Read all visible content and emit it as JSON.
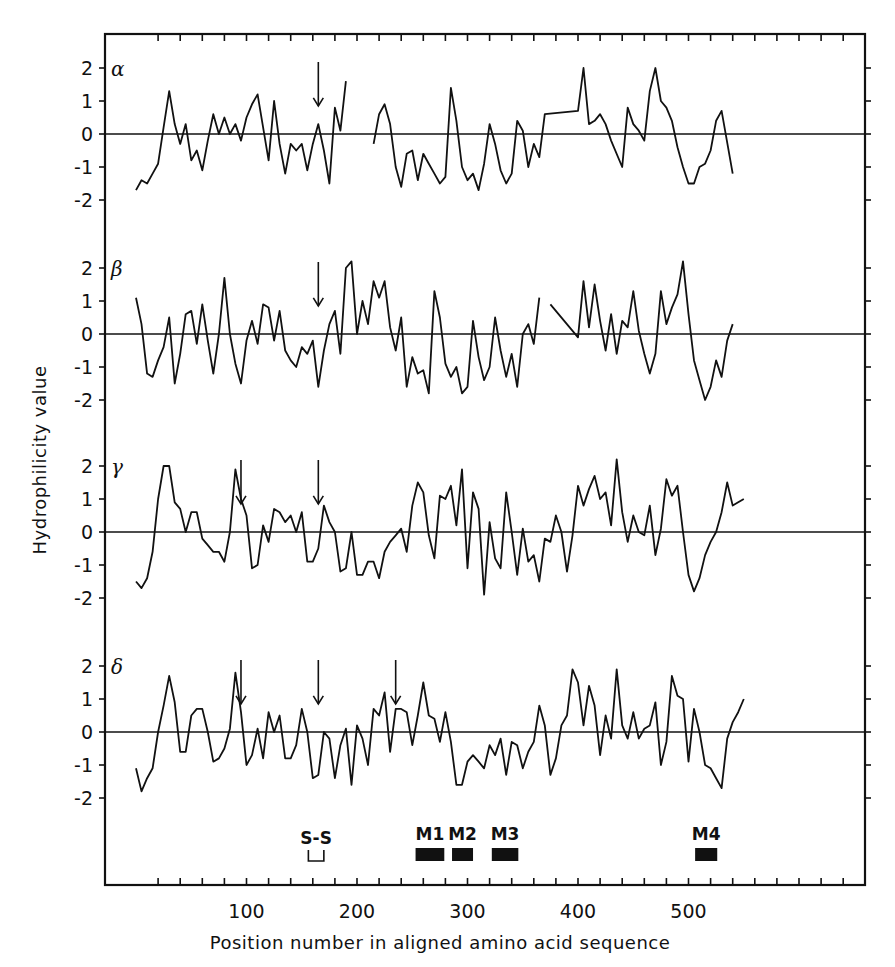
{
  "chart_data": {
    "type": "line",
    "title": "",
    "xlabel": "Position number in aligned amino acid sequence",
    "ylabel": "Hydrophilicity value",
    "xlim": [
      0,
      550
    ],
    "x_ticks": [
      100,
      200,
      300,
      400,
      500
    ],
    "x_minor_tick_step": 20,
    "ylim_per_panel": [
      -2,
      2
    ],
    "y_ticks": [
      2,
      1,
      0,
      -1,
      -2
    ],
    "y_tick_labels": [
      "2",
      "1",
      "0",
      "-1",
      "-2"
    ],
    "grid": false,
    "legend": null,
    "panels": [
      {
        "name": "α",
        "arrows_at": [
          165
        ],
        "x": [
          0,
          5,
          10,
          15,
          20,
          25,
          30,
          35,
          40,
          45,
          50,
          55,
          60,
          65,
          70,
          75,
          80,
          85,
          90,
          95,
          100,
          105,
          110,
          115,
          120,
          125,
          130,
          135,
          140,
          145,
          150,
          155,
          160,
          165,
          170,
          175,
          180,
          185,
          190,
          195,
          200,
          210,
          215,
          220,
          225,
          230,
          235,
          240,
          245,
          250,
          255,
          260,
          265,
          270,
          275,
          280,
          285,
          290,
          295,
          300,
          305,
          310,
          315,
          320,
          325,
          330,
          335,
          340,
          345,
          350,
          355,
          360,
          365,
          370,
          400,
          405,
          410,
          415,
          420,
          425,
          430,
          440,
          445,
          450,
          455,
          460,
          465,
          470,
          475,
          480,
          485,
          490,
          495,
          500,
          505,
          510,
          515,
          520,
          525,
          530,
          540
        ],
        "values": [
          -1.7,
          -1.4,
          -1.5,
          -1.2,
          -0.9,
          0.2,
          1.3,
          0.3,
          -0.3,
          0.3,
          -0.8,
          -0.5,
          -1.1,
          -0.2,
          0.6,
          0.0,
          0.5,
          0.0,
          0.3,
          -0.2,
          0.5,
          0.9,
          1.2,
          0.2,
          -0.8,
          1.0,
          -0.3,
          -1.2,
          -0.3,
          -0.5,
          -0.3,
          -1.1,
          -0.3,
          0.3,
          -0.5,
          -1.5,
          0.8,
          0.1,
          1.6,
          null,
          2.0,
          null,
          -0.3,
          0.6,
          0.9,
          0.3,
          -1.0,
          -1.6,
          -0.6,
          -0.5,
          -1.4,
          -0.6,
          -0.9,
          -1.2,
          -1.5,
          -1.3,
          1.4,
          0.4,
          -1.0,
          -1.4,
          -1.2,
          -1.7,
          -0.9,
          0.3,
          -0.3,
          -1.1,
          -1.5,
          -1.2,
          0.4,
          0.1,
          -1.0,
          -0.3,
          -0.7,
          0.6,
          0.7,
          2.0,
          0.3,
          0.4,
          0.6,
          0.3,
          -0.2,
          -1.0,
          0.8,
          0.3,
          0.1,
          -0.2,
          1.3,
          2.0,
          1.0,
          0.8,
          0.4,
          -0.4,
          -1.0,
          -1.5,
          -1.5,
          -1.0,
          -0.9,
          -0.5,
          0.4,
          0.7,
          -1.2
        ]
      },
      {
        "name": "β",
        "arrows_at": [
          165
        ],
        "x": [
          0,
          5,
          10,
          15,
          20,
          25,
          30,
          35,
          40,
          45,
          50,
          55,
          60,
          65,
          70,
          75,
          80,
          85,
          90,
          95,
          100,
          105,
          110,
          115,
          120,
          125,
          130,
          135,
          140,
          145,
          150,
          155,
          160,
          165,
          170,
          175,
          180,
          185,
          190,
          195,
          200,
          205,
          210,
          215,
          220,
          225,
          230,
          235,
          240,
          245,
          250,
          255,
          260,
          265,
          270,
          275,
          280,
          285,
          290,
          295,
          300,
          305,
          310,
          315,
          320,
          325,
          330,
          335,
          340,
          345,
          350,
          355,
          360,
          365,
          370,
          375,
          400,
          405,
          410,
          415,
          420,
          425,
          430,
          435,
          440,
          445,
          450,
          455,
          460,
          465,
          470,
          475,
          480,
          485,
          490,
          495,
          500,
          505,
          510,
          515,
          520,
          525,
          530,
          535,
          540
        ],
        "values": [
          1.1,
          0.3,
          -1.2,
          -1.3,
          -0.8,
          -0.4,
          0.5,
          -1.5,
          -0.6,
          0.6,
          0.7,
          -0.3,
          0.9,
          -0.2,
          -1.2,
          0.0,
          1.7,
          0.0,
          -0.9,
          -1.5,
          -0.2,
          0.4,
          -0.3,
          0.9,
          0.8,
          -0.2,
          0.7,
          -0.5,
          -0.8,
          -1.0,
          -0.4,
          -0.6,
          -0.2,
          -1.6,
          -0.5,
          0.3,
          0.7,
          -0.6,
          2.0,
          2.2,
          0.0,
          1.0,
          0.3,
          1.6,
          1.1,
          1.6,
          0.2,
          -0.5,
          0.5,
          -1.6,
          -0.7,
          -1.2,
          -1.1,
          -1.8,
          1.3,
          0.5,
          -0.9,
          -1.3,
          -1.0,
          -1.8,
          -1.6,
          0.4,
          -0.7,
          -1.4,
          -1.0,
          0.5,
          -0.5,
          -1.3,
          -0.6,
          -1.6,
          0.0,
          0.3,
          -0.3,
          1.1,
          null,
          0.9,
          -0.1,
          1.6,
          0.2,
          1.5,
          0.4,
          -0.5,
          0.6,
          -0.6,
          0.4,
          0.2,
          1.3,
          0.1,
          -0.6,
          -1.2,
          -0.6,
          1.3,
          0.3,
          0.8,
          1.2,
          2.2,
          0.6,
          -0.8,
          -1.4,
          -2.0,
          -1.6,
          -0.8,
          -1.3,
          -0.2,
          0.3,
          -0.1,
          -0.5
        ]
      },
      {
        "name": "γ",
        "arrows_at": [
          95,
          165
        ],
        "x": [
          0,
          5,
          10,
          15,
          20,
          25,
          30,
          35,
          40,
          45,
          50,
          55,
          60,
          65,
          70,
          75,
          80,
          85,
          90,
          95,
          100,
          105,
          110,
          115,
          120,
          125,
          130,
          135,
          140,
          145,
          150,
          155,
          160,
          165,
          170,
          175,
          180,
          185,
          190,
          195,
          200,
          205,
          210,
          215,
          220,
          225,
          230,
          235,
          240,
          245,
          250,
          255,
          260,
          265,
          270,
          275,
          280,
          285,
          290,
          295,
          300,
          305,
          310,
          315,
          320,
          325,
          330,
          335,
          340,
          345,
          350,
          355,
          360,
          365,
          370,
          375,
          380,
          385,
          390,
          395,
          400,
          405,
          410,
          415,
          420,
          425,
          430,
          435,
          440,
          445,
          450,
          455,
          460,
          465,
          470,
          475,
          480,
          485,
          490,
          495,
          500,
          505,
          510,
          515,
          520,
          525,
          530,
          535,
          540,
          545,
          550
        ],
        "values": [
          -1.5,
          -1.7,
          -1.4,
          -0.6,
          1.0,
          2.0,
          2.0,
          0.9,
          0.7,
          0.0,
          0.6,
          0.6,
          -0.2,
          -0.4,
          -0.6,
          -0.6,
          -0.9,
          0.0,
          1.9,
          1.0,
          0.5,
          -1.1,
          -1.0,
          0.2,
          -0.3,
          0.7,
          0.6,
          0.3,
          0.5,
          0.0,
          0.6,
          -0.9,
          -0.9,
          -0.5,
          0.8,
          0.3,
          0.0,
          -1.2,
          -1.1,
          0.0,
          -1.3,
          -1.3,
          -0.9,
          -0.9,
          -1.4,
          -0.6,
          -0.3,
          -0.1,
          0.1,
          -0.6,
          0.8,
          1.5,
          1.2,
          -0.1,
          -0.8,
          1.1,
          1.0,
          1.4,
          0.2,
          1.9,
          -1.1,
          1.2,
          0.7,
          -1.9,
          0.3,
          -0.8,
          -1.1,
          1.2,
          0.0,
          -1.3,
          0.1,
          -0.9,
          -0.7,
          -1.5,
          -0.2,
          -0.3,
          0.5,
          0.0,
          -1.2,
          -0.1,
          1.4,
          0.8,
          1.3,
          1.7,
          1.0,
          1.2,
          0.2,
          2.2,
          0.6,
          -0.3,
          0.5,
          0.0,
          -0.1,
          0.8,
          -0.7,
          0.1,
          1.6,
          1.1,
          1.4,
          0.0,
          -1.3,
          -1.8,
          -1.4,
          -0.7,
          -0.3,
          0.0,
          0.6,
          1.5,
          0.8,
          0.9,
          1.0
        ]
      },
      {
        "name": "δ",
        "arrows_at": [
          95,
          165,
          235
        ],
        "x": [
          0,
          5,
          10,
          15,
          20,
          25,
          30,
          35,
          40,
          45,
          50,
          55,
          60,
          65,
          70,
          75,
          80,
          85,
          90,
          95,
          100,
          105,
          110,
          115,
          120,
          125,
          130,
          135,
          140,
          145,
          150,
          155,
          160,
          165,
          170,
          175,
          180,
          185,
          190,
          195,
          200,
          205,
          210,
          215,
          220,
          225,
          230,
          235,
          240,
          245,
          250,
          255,
          260,
          265,
          270,
          275,
          280,
          285,
          290,
          295,
          300,
          305,
          310,
          315,
          320,
          325,
          330,
          335,
          340,
          345,
          350,
          355,
          360,
          365,
          370,
          375,
          380,
          385,
          390,
          395,
          400,
          405,
          410,
          415,
          420,
          425,
          430,
          435,
          440,
          445,
          450,
          455,
          460,
          465,
          470,
          475,
          480,
          485,
          490,
          495,
          500,
          505,
          510,
          515,
          520,
          525,
          530,
          535,
          540,
          545,
          550
        ],
        "values": [
          -1.1,
          -1.8,
          -1.4,
          -1.1,
          0.0,
          0.8,
          1.7,
          0.9,
          -0.6,
          -0.6,
          0.5,
          0.7,
          0.7,
          0.0,
          -0.9,
          -0.8,
          -0.5,
          0.1,
          1.8,
          0.6,
          -1.0,
          -0.7,
          0.1,
          -0.8,
          0.6,
          0.0,
          0.5,
          -0.8,
          -0.8,
          -0.4,
          0.7,
          0.0,
          -1.4,
          -1.3,
          0.0,
          -0.2,
          -1.4,
          -0.4,
          0.1,
          -1.6,
          0.2,
          -0.2,
          -1.0,
          0.7,
          0.5,
          1.2,
          -0.6,
          0.7,
          0.7,
          0.6,
          -0.4,
          0.5,
          1.5,
          0.5,
          0.4,
          -0.3,
          0.6,
          -0.3,
          -1.6,
          -1.6,
          -0.9,
          -0.7,
          -0.9,
          -1.1,
          -0.4,
          -0.7,
          -0.2,
          -1.3,
          -0.3,
          -0.4,
          -1.1,
          -0.6,
          -0.3,
          0.8,
          0.2,
          -1.3,
          -0.8,
          0.2,
          0.5,
          1.9,
          1.5,
          0.2,
          1.4,
          0.8,
          -0.7,
          0.5,
          -0.2,
          1.9,
          0.2,
          -0.2,
          0.6,
          -0.2,
          0.1,
          0.2,
          0.9,
          -1.0,
          -0.3,
          1.7,
          1.1,
          1.0,
          -0.9,
          0.7,
          0.0,
          -1.0,
          -1.1,
          -1.4,
          -1.7,
          -0.2,
          0.3,
          0.6,
          1.0
        ]
      }
    ],
    "annotations": [
      {
        "label": "S-S",
        "type": "bracket",
        "x_start": 156,
        "x_end": 170
      },
      {
        "label": "M1",
        "type": "bar",
        "x_start": 253,
        "x_end": 279
      },
      {
        "label": "M2",
        "type": "bar",
        "x_start": 286,
        "x_end": 305
      },
      {
        "label": "M3",
        "type": "bar",
        "x_start": 322,
        "x_end": 346
      },
      {
        "label": "M4",
        "type": "bar",
        "x_start": 506,
        "x_end": 526
      }
    ]
  }
}
